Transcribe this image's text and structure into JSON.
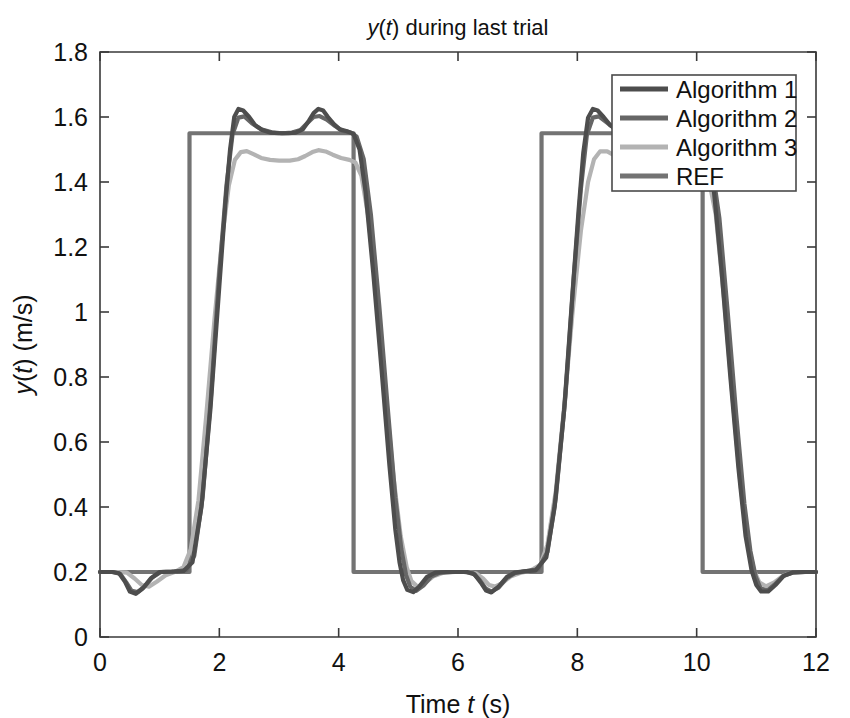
{
  "chart_data": {
    "type": "line",
    "title": "y(t) during last trial",
    "title_parts": [
      {
        "text": "y",
        "italic": true
      },
      {
        "text": "(",
        "italic": false
      },
      {
        "text": "t",
        "italic": true
      },
      {
        "text": ") during last trial",
        "italic": false
      }
    ],
    "xlabel": "Time t (s)",
    "xlabel_parts": [
      {
        "text": "Time ",
        "italic": false
      },
      {
        "text": "t",
        "italic": true
      },
      {
        "text": " (s)",
        "italic": false
      }
    ],
    "ylabel": "y(t) (m/s)",
    "ylabel_parts": [
      {
        "text": "y",
        "italic": true
      },
      {
        "text": "(",
        "italic": false
      },
      {
        "text": "t",
        "italic": true
      },
      {
        "text": ") (m/s)",
        "italic": false
      }
    ],
    "xlim": [
      0,
      12
    ],
    "ylim": [
      0,
      1.8
    ],
    "xticks": [
      0,
      2,
      4,
      6,
      8,
      10,
      12
    ],
    "xticklabels": [
      "0",
      "2",
      "4",
      "6",
      "8",
      "10",
      "12"
    ],
    "yticks": [
      0,
      0.2,
      0.4,
      0.6,
      0.8,
      1,
      1.2,
      1.4,
      1.6,
      1.8
    ],
    "yticklabels": [
      "0",
      "0.2",
      "0.4",
      "0.6",
      "0.8",
      "1",
      "1.2",
      "1.4",
      "1.6",
      "1.8"
    ],
    "grid": false,
    "legend_position": "upper right",
    "reference_levels": {
      "low": 0.2,
      "high": 1.55
    },
    "series": [
      {
        "name": "Algorithm 1",
        "color": "#4d4d4d",
        "width": 4.2,
        "points": [
          [
            0.0,
            0.2
          ],
          [
            0.2,
            0.2
          ],
          [
            0.32,
            0.196
          ],
          [
            0.42,
            0.17
          ],
          [
            0.5,
            0.14
          ],
          [
            0.6,
            0.133
          ],
          [
            0.72,
            0.15
          ],
          [
            0.85,
            0.18
          ],
          [
            1.0,
            0.2
          ],
          [
            1.2,
            0.201
          ],
          [
            1.4,
            0.203
          ],
          [
            1.55,
            0.23
          ],
          [
            1.7,
            0.4
          ],
          [
            1.85,
            0.7
          ],
          [
            2.0,
            1.08
          ],
          [
            2.1,
            1.33
          ],
          [
            2.18,
            1.5
          ],
          [
            2.25,
            1.6
          ],
          [
            2.32,
            1.625
          ],
          [
            2.4,
            1.62
          ],
          [
            2.5,
            1.6
          ],
          [
            2.6,
            1.575
          ],
          [
            2.72,
            1.56
          ],
          [
            2.85,
            1.552
          ],
          [
            3.0,
            1.55
          ],
          [
            3.15,
            1.55
          ],
          [
            3.28,
            1.552
          ],
          [
            3.4,
            1.562
          ],
          [
            3.5,
            1.588
          ],
          [
            3.58,
            1.612
          ],
          [
            3.66,
            1.625
          ],
          [
            3.74,
            1.62
          ],
          [
            3.82,
            1.6
          ],
          [
            3.92,
            1.578
          ],
          [
            4.02,
            1.562
          ],
          [
            4.14,
            1.556
          ],
          [
            4.25,
            1.548
          ],
          [
            4.35,
            1.5
          ],
          [
            4.45,
            1.37
          ],
          [
            4.58,
            1.12
          ],
          [
            4.72,
            0.82
          ],
          [
            4.85,
            0.53
          ],
          [
            4.95,
            0.33
          ],
          [
            5.02,
            0.23
          ],
          [
            5.08,
            0.175
          ],
          [
            5.15,
            0.145
          ],
          [
            5.25,
            0.138
          ],
          [
            5.35,
            0.155
          ],
          [
            5.48,
            0.185
          ],
          [
            5.62,
            0.198
          ],
          [
            5.8,
            0.2
          ],
          [
            6.0,
            0.2
          ],
          [
            6.15,
            0.2
          ],
          [
            6.28,
            0.192
          ],
          [
            6.38,
            0.168
          ],
          [
            6.47,
            0.143
          ],
          [
            6.56,
            0.137
          ],
          [
            6.68,
            0.155
          ],
          [
            6.82,
            0.185
          ],
          [
            6.95,
            0.198
          ],
          [
            7.1,
            0.202
          ],
          [
            7.3,
            0.205
          ],
          [
            7.48,
            0.245
          ],
          [
            7.62,
            0.4
          ],
          [
            7.78,
            0.7
          ],
          [
            7.92,
            1.06
          ],
          [
            8.02,
            1.31
          ],
          [
            8.1,
            1.49
          ],
          [
            8.18,
            1.598
          ],
          [
            8.26,
            1.625
          ],
          [
            8.34,
            1.62
          ],
          [
            8.44,
            1.6
          ],
          [
            8.55,
            1.575
          ],
          [
            8.68,
            1.56
          ],
          [
            8.82,
            1.552
          ],
          [
            9.0,
            1.55
          ],
          [
            9.2,
            1.55
          ],
          [
            9.4,
            1.55
          ],
          [
            9.6,
            1.55
          ],
          [
            9.8,
            1.55
          ],
          [
            10.0,
            1.548
          ],
          [
            10.15,
            1.51
          ],
          [
            10.28,
            1.39
          ],
          [
            10.42,
            1.12
          ],
          [
            10.56,
            0.81
          ],
          [
            10.7,
            0.52
          ],
          [
            10.82,
            0.31
          ],
          [
            10.92,
            0.205
          ],
          [
            11.0,
            0.16
          ],
          [
            11.08,
            0.14
          ],
          [
            11.2,
            0.14
          ],
          [
            11.32,
            0.16
          ],
          [
            11.46,
            0.188
          ],
          [
            11.62,
            0.199
          ],
          [
            11.8,
            0.2
          ],
          [
            12.0,
            0.2
          ]
        ]
      },
      {
        "name": "Algorithm 2",
        "color": "#666666",
        "width": 4.2,
        "points": [
          [
            0.0,
            0.2
          ],
          [
            0.22,
            0.2
          ],
          [
            0.34,
            0.194
          ],
          [
            0.44,
            0.168
          ],
          [
            0.53,
            0.142
          ],
          [
            0.63,
            0.138
          ],
          [
            0.75,
            0.156
          ],
          [
            0.88,
            0.184
          ],
          [
            1.02,
            0.2
          ],
          [
            1.25,
            0.201
          ],
          [
            1.45,
            0.206
          ],
          [
            1.58,
            0.25
          ],
          [
            1.72,
            0.43
          ],
          [
            1.86,
            0.74
          ],
          [
            2.0,
            1.12
          ],
          [
            2.12,
            1.39
          ],
          [
            2.22,
            1.545
          ],
          [
            2.32,
            1.598
          ],
          [
            2.42,
            1.602
          ],
          [
            2.55,
            1.58
          ],
          [
            2.7,
            1.562
          ],
          [
            2.88,
            1.553
          ],
          [
            3.05,
            1.55
          ],
          [
            3.22,
            1.552
          ],
          [
            3.36,
            1.56
          ],
          [
            3.48,
            1.582
          ],
          [
            3.58,
            1.6
          ],
          [
            3.68,
            1.603
          ],
          [
            3.8,
            1.592
          ],
          [
            3.94,
            1.572
          ],
          [
            4.06,
            1.558
          ],
          [
            4.2,
            1.552
          ],
          [
            4.3,
            1.54
          ],
          [
            4.42,
            1.47
          ],
          [
            4.54,
            1.3
          ],
          [
            4.68,
            1.02
          ],
          [
            4.82,
            0.71
          ],
          [
            4.95,
            0.43
          ],
          [
            5.05,
            0.27
          ],
          [
            5.13,
            0.19
          ],
          [
            5.2,
            0.155
          ],
          [
            5.3,
            0.142
          ],
          [
            5.42,
            0.158
          ],
          [
            5.55,
            0.186
          ],
          [
            5.7,
            0.198
          ],
          [
            5.9,
            0.2
          ],
          [
            6.1,
            0.2
          ],
          [
            6.25,
            0.197
          ],
          [
            6.36,
            0.176
          ],
          [
            6.46,
            0.15
          ],
          [
            6.56,
            0.14
          ],
          [
            6.68,
            0.152
          ],
          [
            6.82,
            0.182
          ],
          [
            6.96,
            0.197
          ],
          [
            7.12,
            0.202
          ],
          [
            7.34,
            0.208
          ],
          [
            7.5,
            0.262
          ],
          [
            7.64,
            0.43
          ],
          [
            7.8,
            0.74
          ],
          [
            7.94,
            1.105
          ],
          [
            8.06,
            1.38
          ],
          [
            8.16,
            1.545
          ],
          [
            8.26,
            1.598
          ],
          [
            8.36,
            1.602
          ],
          [
            8.48,
            1.585
          ],
          [
            8.62,
            1.565
          ],
          [
            8.78,
            1.554
          ],
          [
            8.96,
            1.55
          ],
          [
            9.2,
            1.55
          ],
          [
            9.45,
            1.55
          ],
          [
            9.7,
            1.55
          ],
          [
            9.95,
            1.549
          ],
          [
            10.1,
            1.54
          ],
          [
            10.24,
            1.47
          ],
          [
            10.38,
            1.29
          ],
          [
            10.52,
            1.0
          ],
          [
            10.66,
            0.69
          ],
          [
            10.8,
            0.41
          ],
          [
            10.9,
            0.265
          ],
          [
            10.99,
            0.185
          ],
          [
            11.07,
            0.15
          ],
          [
            11.18,
            0.142
          ],
          [
            11.3,
            0.16
          ],
          [
            11.45,
            0.188
          ],
          [
            11.62,
            0.199
          ],
          [
            11.82,
            0.2
          ],
          [
            12.0,
            0.2
          ]
        ]
      },
      {
        "name": "Algorithm 3",
        "color": "#b3b3b3",
        "width": 4.2,
        "points": [
          [
            0.0,
            0.2
          ],
          [
            0.3,
            0.2
          ],
          [
            0.45,
            0.198
          ],
          [
            0.58,
            0.18
          ],
          [
            0.7,
            0.16
          ],
          [
            0.82,
            0.155
          ],
          [
            0.95,
            0.17
          ],
          [
            1.1,
            0.19
          ],
          [
            1.25,
            0.2
          ],
          [
            1.4,
            0.215
          ],
          [
            1.52,
            0.27
          ],
          [
            1.65,
            0.42
          ],
          [
            1.78,
            0.68
          ],
          [
            1.92,
            0.98
          ],
          [
            2.05,
            1.23
          ],
          [
            2.16,
            1.39
          ],
          [
            2.26,
            1.468
          ],
          [
            2.36,
            1.492
          ],
          [
            2.46,
            1.495
          ],
          [
            2.58,
            1.485
          ],
          [
            2.7,
            1.474
          ],
          [
            2.85,
            1.468
          ],
          [
            3.0,
            1.466
          ],
          [
            3.18,
            1.466
          ],
          [
            3.32,
            1.47
          ],
          [
            3.44,
            1.48
          ],
          [
            3.56,
            1.492
          ],
          [
            3.66,
            1.498
          ],
          [
            3.78,
            1.494
          ],
          [
            3.9,
            1.484
          ],
          [
            4.04,
            1.474
          ],
          [
            4.18,
            1.468
          ],
          [
            4.28,
            1.46
          ],
          [
            4.38,
            1.42
          ],
          [
            4.5,
            1.29
          ],
          [
            4.64,
            1.04
          ],
          [
            4.78,
            0.76
          ],
          [
            4.92,
            0.49
          ],
          [
            5.04,
            0.31
          ],
          [
            5.14,
            0.215
          ],
          [
            5.22,
            0.172
          ],
          [
            5.32,
            0.155
          ],
          [
            5.44,
            0.165
          ],
          [
            5.58,
            0.186
          ],
          [
            5.74,
            0.197
          ],
          [
            5.95,
            0.2
          ],
          [
            6.15,
            0.2
          ],
          [
            6.3,
            0.196
          ],
          [
            6.42,
            0.18
          ],
          [
            6.52,
            0.16
          ],
          [
            6.62,
            0.155
          ],
          [
            6.74,
            0.166
          ],
          [
            6.88,
            0.186
          ],
          [
            7.04,
            0.197
          ],
          [
            7.2,
            0.203
          ],
          [
            7.38,
            0.222
          ],
          [
            7.5,
            0.285
          ],
          [
            7.64,
            0.45
          ],
          [
            7.78,
            0.71
          ],
          [
            7.92,
            1.0
          ],
          [
            8.06,
            1.25
          ],
          [
            8.18,
            1.4
          ],
          [
            8.28,
            1.47
          ],
          [
            8.38,
            1.494
          ],
          [
            8.5,
            1.494
          ],
          [
            8.62,
            1.482
          ],
          [
            8.76,
            1.472
          ],
          [
            8.92,
            1.467
          ],
          [
            9.12,
            1.466
          ],
          [
            9.38,
            1.466
          ],
          [
            9.64,
            1.467
          ],
          [
            9.88,
            1.468
          ],
          [
            10.06,
            1.464
          ],
          [
            10.18,
            1.43
          ],
          [
            10.32,
            1.3
          ],
          [
            10.46,
            1.04
          ],
          [
            10.6,
            0.74
          ],
          [
            10.74,
            0.46
          ],
          [
            10.86,
            0.29
          ],
          [
            10.96,
            0.205
          ],
          [
            11.05,
            0.168
          ],
          [
            11.16,
            0.156
          ],
          [
            11.3,
            0.168
          ],
          [
            11.46,
            0.19
          ],
          [
            11.64,
            0.199
          ],
          [
            11.84,
            0.2
          ],
          [
            12.0,
            0.2
          ]
        ]
      },
      {
        "name": "REF",
        "color": "#737373",
        "width": 4.2,
        "points": [
          [
            0.0,
            0.2
          ],
          [
            1.5,
            0.2
          ],
          [
            1.5,
            1.55
          ],
          [
            4.25,
            1.55
          ],
          [
            4.25,
            0.2
          ],
          [
            7.4,
            0.2
          ],
          [
            7.4,
            1.55
          ],
          [
            10.1,
            1.55
          ],
          [
            10.1,
            0.2
          ],
          [
            12.0,
            0.2
          ]
        ]
      }
    ]
  },
  "legend": {
    "entries": [
      {
        "label": "Algorithm 1",
        "color": "#4d4d4d"
      },
      {
        "label": "Algorithm 2",
        "color": "#666666"
      },
      {
        "label": "Algorithm 3",
        "color": "#b3b3b3"
      },
      {
        "label": "REF",
        "color": "#737373"
      }
    ]
  },
  "colors": {
    "background": "#ffffff",
    "axis": "#3a3a3a",
    "text": "#111111"
  }
}
